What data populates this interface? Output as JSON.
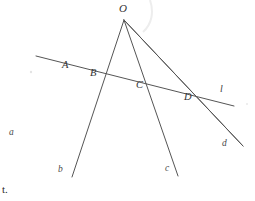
{
  "figure": {
    "apex": {
      "name": "O",
      "x": 124,
      "y": 20
    },
    "transversal": {
      "name": "l",
      "label": "l",
      "label_x": 220,
      "label_y": 89,
      "x1": 36,
      "y1": 56,
      "x2": 234,
      "y2": 106
    },
    "rays": [
      {
        "name": "a",
        "label": "a",
        "end_x": 31,
        "end_y": 136,
        "label_x": 10,
        "label_y": 133
      },
      {
        "name": "b",
        "label": "b",
        "end_x": 72,
        "end_y": 177,
        "label_x": 59,
        "label_y": 170
      },
      {
        "name": "c",
        "label": "c",
        "end_x": 178,
        "end_y": 176,
        "label_x": 165,
        "label_y": 169
      },
      {
        "name": "d",
        "label": "d",
        "end_x": 243,
        "end_y": 146,
        "label_x": 223,
        "label_y": 145
      }
    ],
    "intersections": [
      {
        "name": "A",
        "label": "A",
        "x": 79,
        "y": 68,
        "label_x": 62,
        "label_y": 66
      },
      {
        "name": "B",
        "label": "B",
        "x": 105,
        "y": 76,
        "label_x": 90,
        "label_y": 74
      },
      {
        "name": "C",
        "label": "C",
        "x": 149,
        "y": 86,
        "label_x": 136,
        "label_y": 86
      },
      {
        "name": "D",
        "label": "D",
        "x": 194,
        "y": 98,
        "label_x": 184,
        "label_y": 98
      }
    ],
    "stroke_color": "#555555",
    "stroke_width": 1,
    "background_color": "#ffffff"
  },
  "margin": {
    "fragment": "t."
  }
}
